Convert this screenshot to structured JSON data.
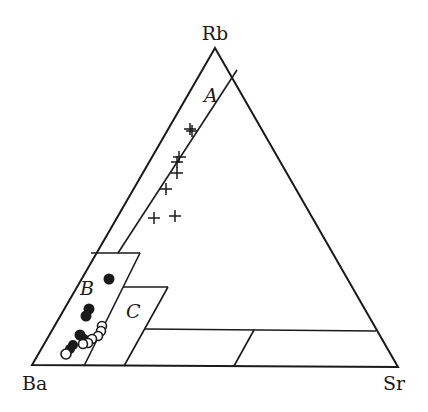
{
  "diagram": {
    "type": "ternary",
    "vertices": {
      "top": "Rb",
      "left": "Ba",
      "right": "Sr"
    },
    "fields": [
      {
        "id": "A",
        "label": "A"
      },
      {
        "id": "B",
        "label": "B"
      },
      {
        "id": "C",
        "label": "C"
      }
    ],
    "series": [
      {
        "name": "plus markers",
        "symbol": "plus",
        "color": "#1a1a1a"
      },
      {
        "name": "filled circles",
        "symbol": "filled-circle",
        "color": "#1a1a1a"
      },
      {
        "name": "open circles",
        "symbol": "open-circle",
        "color": "#1a1a1a"
      }
    ]
  }
}
